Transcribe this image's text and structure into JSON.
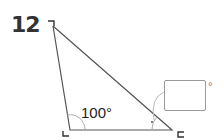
{
  "question": {
    "number": "12"
  },
  "triangle": {
    "vertices": {
      "top": [
        53,
        26
      ],
      "bottom_left": [
        70,
        130
      ],
      "bottom_right": [
        172,
        130
      ]
    },
    "known_angle": {
      "label": "100°",
      "value": 100,
      "unit": "degrees",
      "vertex": "bottom_left"
    },
    "unknown_angle": {
      "vertex": "bottom_right",
      "answer_value": "",
      "unit_symbol": "°"
    }
  },
  "colors": {
    "lines": "#555555",
    "text": "#222222",
    "box_border": "#999999"
  }
}
